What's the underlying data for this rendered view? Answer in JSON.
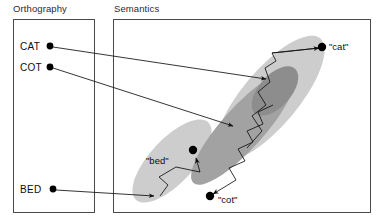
{
  "figure": {
    "kind": "diagram",
    "panels": [
      {
        "id": "orthography",
        "title": "Orthography"
      },
      {
        "id": "semantics",
        "title": "Semantics"
      }
    ],
    "orthography_nodes": [
      {
        "id": "cat",
        "label": "CAT"
      },
      {
        "id": "cot",
        "label": "COT"
      },
      {
        "id": "bed",
        "label": "BED"
      }
    ],
    "semantic_nodes": [
      {
        "id": "sem-cat",
        "label": "\"cat\""
      },
      {
        "id": "sem-bed",
        "label": "\"bed\""
      },
      {
        "id": "sem-cot",
        "label": "\"cot\""
      }
    ],
    "colors": {
      "box_border": "#4a4a4a",
      "ellipse_light": "#cdcdcd",
      "ellipse_dark": "#a2a2a2",
      "ellipse_darkest": "#8d8d8d",
      "stroke": "#111111",
      "node_fill": "#000000",
      "background": "#ffffff"
    },
    "mappings": [
      {
        "from": "CAT",
        "to": "semantic region upper",
        "type": "arrow"
      },
      {
        "from": "COT",
        "to": "semantic region middle",
        "type": "arrow"
      },
      {
        "from": "BED",
        "to": "semantic region lower-left",
        "type": "arrow"
      }
    ],
    "trajectories": [
      {
        "id": "traj-cat",
        "endpoint": "\"cat\"",
        "style": "zigzag-settling"
      },
      {
        "id": "traj-bed",
        "endpoint": "\"bed\"",
        "style": "zigzag-settling"
      },
      {
        "id": "traj-cot",
        "endpoint": "\"cot\"",
        "style": "zigzag-settling"
      }
    ]
  }
}
